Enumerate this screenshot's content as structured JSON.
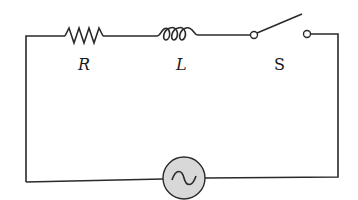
{
  "diagram": {
    "type": "RL circuit with switch and AC source",
    "components": [
      {
        "id": "resistor",
        "label": "R"
      },
      {
        "id": "inductor",
        "label": "L"
      },
      {
        "id": "switch",
        "label": "S",
        "state": "open"
      },
      {
        "id": "ac_source",
        "label": ""
      }
    ],
    "colors": {
      "wire": "#2a2a2a",
      "source_fill": "#d8d8d8"
    }
  }
}
